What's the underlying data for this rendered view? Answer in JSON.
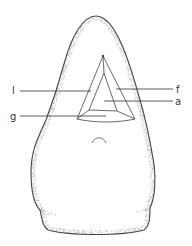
{
  "figure": {
    "colors": {
      "background": "#ffffff",
      "stroke": "#333333",
      "stipple": "#555555"
    },
    "labels": [
      {
        "id": "l",
        "text": "l",
        "side": "left"
      },
      {
        "id": "f",
        "text": "f",
        "side": "right"
      },
      {
        "id": "a",
        "text": "a",
        "side": "right"
      },
      {
        "id": "g",
        "text": "g",
        "side": "left"
      }
    ]
  }
}
